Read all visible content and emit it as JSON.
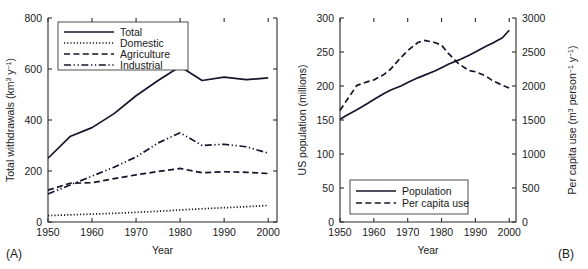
{
  "figure": {
    "panel_a_tag": "(A)",
    "panel_b_tag": "(B)"
  },
  "chart_data": [
    {
      "type": "line",
      "panel": "(A)",
      "title": "",
      "xlabel": "Year",
      "ylabel": "Total withdrawals (km3 y-1)",
      "ylabel_parts": {
        "text": "Total withdrawals (km",
        "sup1": "3",
        "mid": " y",
        "sup2": "−1",
        "close": ")"
      },
      "xlim": [
        1950,
        2002
      ],
      "ylim": [
        0,
        800
      ],
      "xticks": [
        1950,
        1960,
        1970,
        1980,
        1990,
        2000
      ],
      "xticklabels": [
        "1950",
        "1960",
        "1970",
        "1980",
        "1990",
        "2000"
      ],
      "yticks": [
        0,
        200,
        400,
        600,
        800
      ],
      "yticklabels": [
        "0",
        "200",
        "400",
        "600",
        "800"
      ],
      "grid": false,
      "legend_position": "upper-left",
      "x": [
        1950,
        1955,
        1960,
        1965,
        1970,
        1975,
        1980,
        1985,
        1990,
        1995,
        2000
      ],
      "series": [
        {
          "name": "Total",
          "dash": "solid",
          "values": [
            250,
            335,
            370,
            425,
            495,
            555,
            610,
            555,
            568,
            558,
            565
          ]
        },
        {
          "name": "Domestic",
          "dash": "dotted",
          "values": [
            25,
            28,
            31,
            34,
            38,
            42,
            47,
            52,
            56,
            60,
            65
          ]
        },
        {
          "name": "Agriculture",
          "dash": "dashed",
          "values": [
            125,
            152,
            154,
            170,
            185,
            198,
            210,
            193,
            197,
            195,
            190
          ]
        },
        {
          "name": "Industrial",
          "dash": "dashdotdot",
          "values": [
            110,
            145,
            180,
            215,
            255,
            310,
            350,
            300,
            305,
            295,
            270
          ]
        }
      ]
    },
    {
      "type": "line",
      "panel": "(B)",
      "title": "",
      "xlabel": "Year",
      "ylabel_left": "US population (millions)",
      "ylabel_right": "Per capita use (m3 person-1 y-1)",
      "ylabel_right_parts": {
        "text": "Per capita use (m",
        "sup1": "3",
        "mid": " person",
        "sup2": "−1",
        "mid2": " y",
        "sup3": "−1",
        "close": ")"
      },
      "xlim": [
        1950,
        2002
      ],
      "ylim_left": [
        0,
        300
      ],
      "ylim_right": [
        0,
        3000
      ],
      "xticks": [
        1950,
        1960,
        1970,
        1980,
        1990,
        2000
      ],
      "xticklabels": [
        "1950",
        "1960",
        "1970",
        "1980",
        "1990",
        "2000"
      ],
      "yticks_left": [
        0,
        50,
        100,
        150,
        200,
        250,
        300
      ],
      "yticklabels_left": [
        "0",
        "50",
        "100",
        "150",
        "200",
        "250",
        "300"
      ],
      "yticks_right": [
        0,
        500,
        1000,
        1500,
        2000,
        2500,
        3000
      ],
      "yticklabels_right": [
        "0",
        "500",
        "1000",
        "1500",
        "2000",
        "2500",
        "3000"
      ],
      "grid": false,
      "legend_position": "lower-left",
      "x": [
        1950,
        1952,
        1955,
        1958,
        1960,
        1963,
        1965,
        1968,
        1970,
        1973,
        1975,
        1978,
        1980,
        1982,
        1985,
        1988,
        1990,
        1993,
        1995,
        1998,
        2000
      ],
      "series": [
        {
          "name": "Population",
          "axis": "left",
          "dash": "solid",
          "values": [
            151,
            157,
            165,
            174,
            180,
            189,
            194,
            200,
            205,
            212,
            216,
            222,
            227,
            232,
            238,
            245,
            250,
            258,
            263,
            271,
            282
          ]
        },
        {
          "name": "Per capita use",
          "axis": "right",
          "dash": "dashed",
          "values": [
            1640,
            1790,
            2010,
            2060,
            2090,
            2170,
            2250,
            2420,
            2520,
            2640,
            2670,
            2640,
            2600,
            2480,
            2330,
            2230,
            2210,
            2150,
            2080,
            2010,
            1970
          ]
        }
      ]
    }
  ],
  "legend_a": {
    "items": [
      {
        "label": "Total",
        "dash": "solid"
      },
      {
        "label": "Domestic",
        "dash": "dotted"
      },
      {
        "label": "Agriculture",
        "dash": "dashed"
      },
      {
        "label": "Industrial",
        "dash": "dashdotdot"
      }
    ]
  },
  "legend_b": {
    "items": [
      {
        "label": "Population",
        "dash": "solid"
      },
      {
        "label": "Per capita use",
        "dash": "dashed"
      }
    ]
  },
  "colors": {
    "line": "#14142b",
    "axis": "#2b2b2b",
    "text": "#1a1a1a",
    "background": "#ffffff"
  }
}
